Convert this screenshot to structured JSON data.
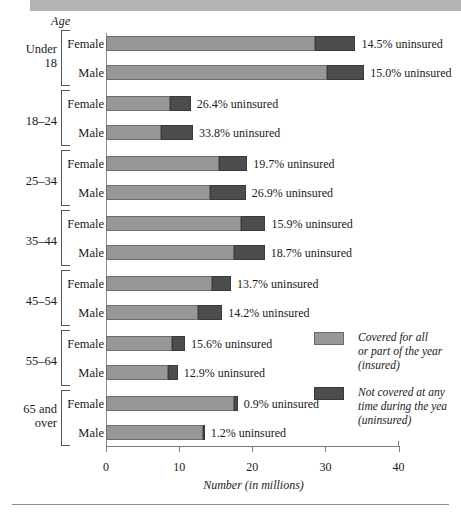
{
  "figure": {
    "age_caption": "Age",
    "xlabel": "Number (in millions)"
  },
  "legend": {
    "insured": {
      "swatch": "legend-swatch-insured",
      "lines": [
        "Covered for all",
        "or part of the year",
        "(insured)"
      ]
    },
    "uninsured": {
      "swatch": "legend-swatch-uninsured",
      "lines": [
        "Not covered at any",
        "time during the yea",
        "(uninsured)"
      ]
    }
  },
  "chart_data": {
    "type": "bar",
    "orientation": "horizontal",
    "stacked": true,
    "title": "",
    "xlabel": "Number (in millions)",
    "ylabel": "Age",
    "xlim": [
      0,
      40
    ],
    "xticks": [
      0,
      10,
      20,
      30,
      40
    ],
    "xtick_labels": [
      "0",
      "10",
      "20",
      "30",
      "40"
    ],
    "grid": false,
    "legend_position": "right",
    "series": [
      {
        "name": "Covered for all or part of the year (insured)",
        "color": "#979797",
        "values": [
          28.6,
          30.2,
          8.8,
          7.5,
          15.5,
          14.2,
          18.4,
          17.5,
          14.5,
          12.6,
          9.0,
          8.5,
          17.5,
          13.3
        ]
      },
      {
        "name": "Not covered at any time during the year (uninsured)",
        "color": "#4d4d4d",
        "values": [
          5.5,
          5.1,
          2.8,
          4.4,
          3.8,
          4.9,
          3.4,
          4.2,
          2.6,
          3.3,
          1.8,
          1.3,
          0.5,
          0.2
        ]
      }
    ],
    "groups": [
      {
        "age": "Under 18",
        "rows": [
          {
            "sex": "Female",
            "insured": 28.6,
            "uninsured": 5.5,
            "note": "14.5% uninsured",
            "percent": "14.5%"
          },
          {
            "sex": "Male",
            "insured": 30.2,
            "uninsured": 5.1,
            "note": "15.0% uninsured",
            "percent": "15.0%"
          }
        ]
      },
      {
        "age": "18–24",
        "rows": [
          {
            "sex": "Female",
            "insured": 8.8,
            "uninsured": 2.8,
            "note": "26.4% uninsured",
            "percent": "26.4%"
          },
          {
            "sex": "Male",
            "insured": 7.5,
            "uninsured": 4.4,
            "note": "33.8% uninsured",
            "percent": "33.8%"
          }
        ]
      },
      {
        "age": "25–34",
        "rows": [
          {
            "sex": "Female",
            "insured": 15.5,
            "uninsured": 3.8,
            "note": "19.7% uninsured",
            "percent": "19.7%"
          },
          {
            "sex": "Male",
            "insured": 14.2,
            "uninsured": 4.9,
            "note": "26.9% uninsured",
            "percent": "26.9%"
          }
        ]
      },
      {
        "age": "35–44",
        "rows": [
          {
            "sex": "Female",
            "insured": 18.4,
            "uninsured": 3.4,
            "note": "15.9% uninsured",
            "percent": "15.9%"
          },
          {
            "sex": "Male",
            "insured": 17.5,
            "uninsured": 4.2,
            "note": "18.7% uninsured",
            "percent": "18.7%"
          }
        ]
      },
      {
        "age": "45–54",
        "rows": [
          {
            "sex": "Female",
            "insured": 14.5,
            "uninsured": 2.6,
            "note": "13.7% uninsured",
            "percent": "13.7%"
          },
          {
            "sex": "Male",
            "insured": 12.6,
            "uninsured": 3.3,
            "note": "14.2% uninsured",
            "percent": "14.2%"
          }
        ]
      },
      {
        "age": "55–64",
        "rows": [
          {
            "sex": "Female",
            "insured": 9.0,
            "uninsured": 1.8,
            "note": "15.6% uninsured",
            "percent": "15.6%"
          },
          {
            "sex": "Male",
            "insured": 8.5,
            "uninsured": 1.3,
            "note": "12.9% uninsured",
            "percent": "12.9%"
          }
        ]
      },
      {
        "age": "65 and over",
        "age_lines": [
          "65 and",
          "over"
        ],
        "rows": [
          {
            "sex": "Female",
            "insured": 17.5,
            "uninsured": 0.5,
            "note": "0.9% uninsured",
            "percent": "0.9%"
          },
          {
            "sex": "Male",
            "insured": 13.3,
            "uninsured": 0.2,
            "note": "1.2% uninsured",
            "percent": "1.2%"
          }
        ]
      }
    ]
  }
}
